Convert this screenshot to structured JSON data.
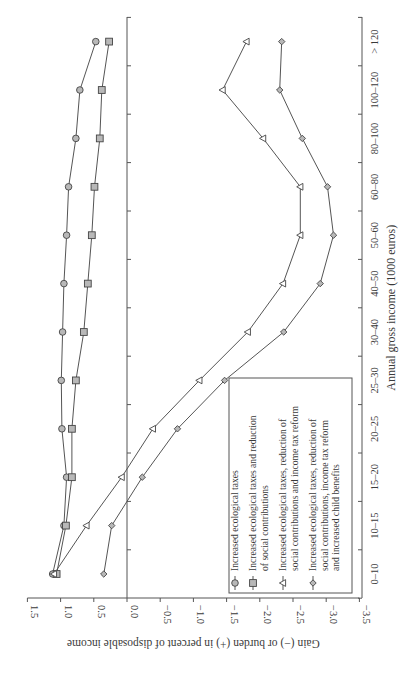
{
  "chart_data": {
    "type": "line",
    "orientation_note": "figure printed rotated 90 degrees clockwise",
    "title": "",
    "xlabel": "Annual gross income (1000 euros)",
    "ylabel": "Gain (−) or burden (+) in percent of disposable income",
    "categories": [
      "0–10",
      "10–15",
      "15–20",
      "20–25",
      "25–30",
      "30–40",
      "40–50",
      "50–60",
      "60–80",
      "80–100",
      "100–120",
      "> 120"
    ],
    "ylim": [
      -3.5,
      1.5
    ],
    "yticks": [
      "1.5",
      "1.0",
      "0.5",
      "0.0",
      "−0.5",
      "−1.0",
      "−1.5",
      "−2.0",
      "−2.5",
      "−3.0",
      "−3.5"
    ],
    "ytick_values": [
      1.5,
      1.0,
      0.5,
      0.0,
      -0.5,
      -1.0,
      -1.5,
      -2.0,
      -2.5,
      -3.0,
      -3.5
    ],
    "grid": false,
    "legend_position": "lower right (in rotated view: bottom-right of plot area)",
    "series": [
      {
        "name": "Increased ecological taxes",
        "marker": "circle",
        "values": [
          1.12,
          0.95,
          0.91,
          0.98,
          0.99,
          0.97,
          0.95,
          0.91,
          0.88,
          0.77,
          0.71,
          0.47
        ]
      },
      {
        "name": "Increased ecological taxes and reduction of social contributions",
        "marker": "square",
        "values": [
          1.06,
          0.92,
          0.83,
          0.83,
          0.77,
          0.65,
          0.59,
          0.53,
          0.49,
          0.41,
          0.38,
          0.27
        ]
      },
      {
        "name": "Increased ecological taxes, reduction of social contributions and income tax reform",
        "marker": "triangle",
        "values": [
          1.1,
          0.61,
          0.08,
          -0.39,
          -1.09,
          -1.82,
          -2.35,
          -2.61,
          -2.61,
          -2.05,
          -1.44,
          -1.8
        ]
      },
      {
        "name": "Increased ecological taxes, reduction of social contributions, income tax reform and increased child benefits",
        "marker": "diamond",
        "values": [
          0.35,
          0.23,
          -0.23,
          -0.76,
          -1.47,
          -2.36,
          -2.91,
          -3.11,
          -3.02,
          -2.64,
          -2.3,
          -2.33
        ]
      }
    ]
  },
  "legend": {
    "items": [
      {
        "lines": [
          "Increased ecological taxes"
        ]
      },
      {
        "lines": [
          "Increased ecological taxes and reduction",
          "of social contributions"
        ]
      },
      {
        "lines": [
          "Increased ecological taxes, reduction of",
          "social contributions and income tax reform"
        ]
      },
      {
        "lines": [
          "Increased ecological taxes, reduction of",
          "social contributions, income tax reform",
          "and increased child benefits"
        ]
      }
    ]
  },
  "colors": {
    "line": "#555555",
    "marker_fill": "#b8b8b8",
    "marker_stroke": "#444444",
    "axis": "#555555",
    "text": "#3a3a3a"
  }
}
